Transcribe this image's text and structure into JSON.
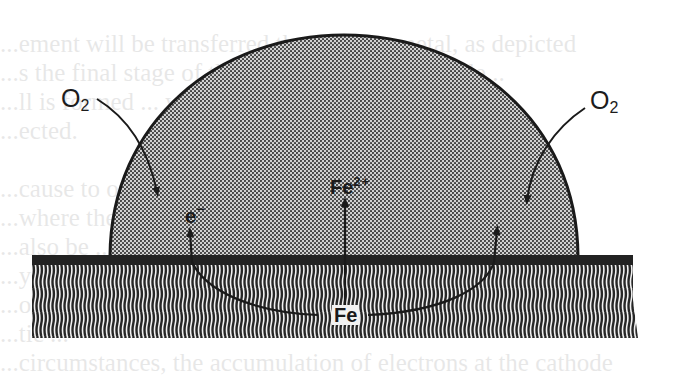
{
  "figure": {
    "type": "corrosion-droplet-diagram",
    "colors": {
      "ink": "#1a1a1a",
      "droplet_fill": "#bdbdbd",
      "metal_bar": "#222222",
      "background": "#ffffff"
    }
  },
  "labels": {
    "oxygen_left": {
      "base": "O",
      "sub": "2"
    },
    "oxygen_right": {
      "base": "O",
      "sub": "2"
    },
    "electron": {
      "base": "e",
      "sup": "−"
    },
    "ferrous_ion": {
      "base": "Fe",
      "sup": "2+"
    },
    "iron": {
      "base": "Fe"
    }
  },
  "regions": {
    "droplet": "electrolyte droplet (stippled)",
    "metal_surface": "iron surface line",
    "metal_bulk": "iron substrate (hatched)"
  },
  "bleed_through_text": [
    "",
    "     ...ement will be transferred through the metal, as depicted",
    "     ...s the final stage of the corrosion process an ele...",
    "     ...ll is formed ... with the surface where the ...",
    "     ...ected.",
    "",
    "     ...cause to occur ... where the ... sites ... el...",
    "     ...where the ... takes place ... such a ...",
    "     ...also be ... of the el...",
    "     ...y the ... ions",
    "     ...ol ... will ...",
    "     ...tic ...",
    "     ...circumstances, the accumulation of electrons at the cathode"
  ]
}
